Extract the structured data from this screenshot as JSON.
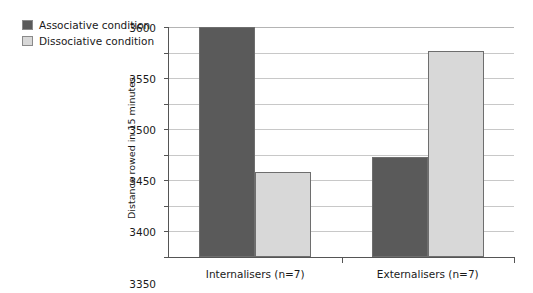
{
  "chart_data": {
    "type": "bar",
    "title": "",
    "xlabel": "",
    "ylabel": "Distance rowed in 15 minutes",
    "categories": [
      "Internalisers (n=7)",
      "Externalisers (n=7)"
    ],
    "series": [
      {
        "name": "Associative condition",
        "color": "#5a5a5a",
        "values": [
          3600,
          3345
        ]
      },
      {
        "name": "Dissociative condition",
        "color": "#d8d8d8",
        "values": [
          3316,
          3553
        ]
      }
    ],
    "ylim": [
      3150,
      3600
    ],
    "yticks": [
      3150,
      3200,
      3250,
      3300,
      3350,
      3400,
      3450,
      3500,
      3550,
      3600
    ],
    "ytick_labels": [
      "3150",
      "3200",
      "3250",
      "3300",
      "3350",
      "3400",
      "3450",
      "3500",
      "3550",
      "3600"
    ],
    "grid": true,
    "legend_position": "top-left"
  },
  "legend": {
    "items": [
      {
        "label": "Associative condition",
        "color": "#5a5a5a"
      },
      {
        "label": "Dissociative condition",
        "color": "#d8d8d8"
      }
    ]
  },
  "axes": {
    "y_title": "Distance rowed in 15 minutes"
  }
}
